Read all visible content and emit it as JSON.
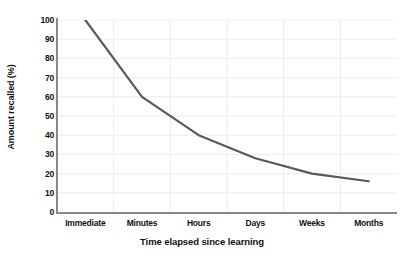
{
  "chart_data": {
    "type": "line",
    "title": "",
    "xlabel": "Time elapsed since learning",
    "ylabel": "Amount recalled (%)",
    "categories": [
      "Immediate",
      "Minutes",
      "Hours",
      "Days",
      "Weeks",
      "Months"
    ],
    "values": [
      100,
      60,
      40,
      28,
      20,
      16
    ],
    "series": [
      {
        "name": "Amount recalled",
        "values": [
          100,
          60,
          40,
          28,
          20,
          16
        ]
      }
    ],
    "ylim": [
      0,
      100
    ],
    "ytick_labels": [
      "0",
      "10",
      "20",
      "30",
      "40",
      "50",
      "60",
      "70",
      "80",
      "90",
      "100"
    ],
    "ytick_values": [
      0,
      10,
      20,
      30,
      40,
      50,
      60,
      70,
      80,
      90,
      100
    ],
    "grid": {
      "horizontal": true,
      "vertical": true,
      "color": "#ececec"
    },
    "legend": null,
    "legend_position": "none",
    "line_color": "#595959",
    "axis_color": "#8a8a8a",
    "background_color": "#ffffff"
  }
}
